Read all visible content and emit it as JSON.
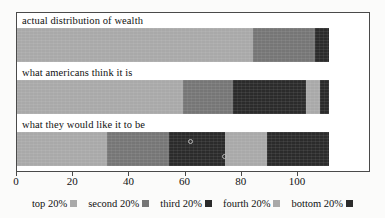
{
  "chart_data": {
    "type": "bar",
    "orientation": "horizontal",
    "stacked": true,
    "title": "",
    "xlabel": "",
    "ylabel": "",
    "grid": false,
    "legend_position": "bottom",
    "xlim": [
      0,
      126
    ],
    "xticks": [
      0,
      20,
      40,
      60,
      80,
      100
    ],
    "xtick_labels": [
      "0",
      "20",
      "40",
      "60",
      "80",
      "100"
    ],
    "categories": [
      "actual distribution of wealth",
      "what americans think it is",
      "what they would like it to be"
    ],
    "series": [
      {
        "name": "top 20%",
        "color": "#a9a9a9",
        "values": [
          84,
          59,
          32
        ]
      },
      {
        "name": "second 20%",
        "color": "#767676",
        "values": [
          22,
          18,
          22
        ]
      },
      {
        "name": "third 20%",
        "color": "#2b2b2b",
        "values": [
          5,
          26,
          20
        ]
      },
      {
        "name": "fourth 20%",
        "color": "#a9a9a9",
        "values": [
          0,
          5,
          15
        ]
      },
      {
        "name": "bottom 20%",
        "color": "#2b2b2b",
        "values": [
          0,
          3,
          22
        ]
      }
    ],
    "annotations": [
      {
        "label": "o",
        "bar": 2,
        "x": 61
      },
      {
        "label": "o",
        "bar": 2,
        "x": 73
      }
    ]
  },
  "legend": {
    "items": [
      {
        "label": "top 20%",
        "swatch": "#a9a9a9"
      },
      {
        "label": "second 20%",
        "swatch": "#767676"
      },
      {
        "label": "third 20%",
        "swatch": "#2b2b2b"
      },
      {
        "label": "fourth 20%",
        "swatch": "#a9a9a9"
      },
      {
        "label": "bottom 20%",
        "swatch": "#2b2b2b"
      }
    ]
  },
  "colors": {
    "frame": "#4a4a4a",
    "background": "#fbfbfa",
    "plot_background": "#ffffff",
    "light_gray": "#a9a9a9",
    "mid_gray": "#767676",
    "dark": "#2b2b2b"
  }
}
